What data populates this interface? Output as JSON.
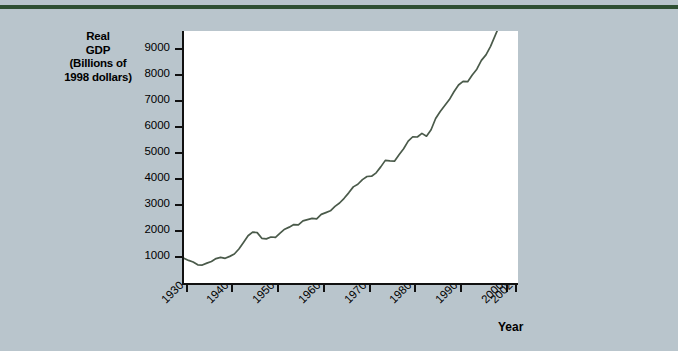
{
  "figure": {
    "background_color": "#b9c5cc",
    "rule_color": "#2f5033",
    "plot_background": "#ffffff",
    "line_color": "#4a5a4a",
    "axis_color": "#111111"
  },
  "axis_title": {
    "line1": "Real",
    "line2": "GDP",
    "line3": "(Billions of",
    "line4": "1998 dollars)"
  },
  "x_axis_label": "Year",
  "chart_data": {
    "type": "line",
    "title": "",
    "xlabel": "Year",
    "ylabel": "Real GDP (Billions of 1998 dollars)",
    "xlim": [
      1929,
      2002
    ],
    "ylim": [
      0,
      9700
    ],
    "grid": false,
    "legend": null,
    "y_ticks": [
      1000,
      2000,
      3000,
      4000,
      5000,
      6000,
      7000,
      8000,
      9000
    ],
    "y_tick_labels": [
      "1000",
      "2000",
      "3000",
      "4000",
      "5000",
      "6000",
      "7000",
      "8000",
      "9000"
    ],
    "x_ticks": [
      1930,
      1940,
      1950,
      1960,
      1970,
      1980,
      1990,
      2000,
      2002
    ],
    "x_tick_labels": [
      "1930",
      "1940",
      "1950",
      "1960",
      "1970",
      "1980",
      "1990",
      "2000",
      "2002"
    ],
    "series": [
      {
        "name": "Real GDP",
        "x": [
          1929,
          1930,
          1931,
          1932,
          1933,
          1934,
          1935,
          1936,
          1937,
          1938,
          1939,
          1940,
          1941,
          1942,
          1943,
          1944,
          1945,
          1946,
          1947,
          1948,
          1949,
          1950,
          1951,
          1952,
          1953,
          1954,
          1955,
          1956,
          1957,
          1958,
          1959,
          1960,
          1961,
          1962,
          1963,
          1964,
          1965,
          1966,
          1967,
          1968,
          1969,
          1970,
          1971,
          1972,
          1973,
          1974,
          1975,
          1976,
          1977,
          1978,
          1979,
          1980,
          1981,
          1982,
          1983,
          1984,
          1985,
          1986,
          1987,
          1988,
          1989,
          1990,
          1991,
          1992,
          1993,
          1994,
          1995,
          1996,
          1997,
          1998,
          1999,
          2000,
          2001,
          2002
        ],
        "y": [
          950,
          870,
          810,
          700,
          690,
          765,
          830,
          940,
          985,
          950,
          1025,
          1115,
          1310,
          1560,
          1820,
          1960,
          1940,
          1720,
          1700,
          1770,
          1760,
          1920,
          2070,
          2150,
          2250,
          2235,
          2390,
          2440,
          2490,
          2470,
          2640,
          2710,
          2780,
          2950,
          3080,
          3260,
          3470,
          3700,
          3800,
          3980,
          4100,
          4110,
          4240,
          4470,
          4720,
          4700,
          4690,
          4940,
          5170,
          5460,
          5630,
          5620,
          5760,
          5650,
          5900,
          6330,
          6600,
          6830,
          7060,
          7360,
          7620,
          7760,
          7750,
          8010,
          8230,
          8570,
          8780,
          9110,
          9520,
          9940,
          10350,
          10700,
          10760,
          11000
        ]
      }
    ]
  }
}
